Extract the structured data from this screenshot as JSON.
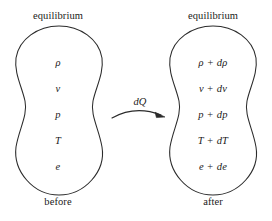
{
  "figure": {
    "background_color": "#ffffff",
    "stroke_color": "#2b2b2b",
    "text_color": "#1a1a1a"
  },
  "left_state": {
    "top_label": "equilibrium",
    "bottom_label": "before",
    "variables": [
      "ρ",
      "v",
      "p",
      "T",
      "e"
    ]
  },
  "right_state": {
    "top_label": "equilibrium",
    "bottom_label": "after",
    "variables": [
      "ρ + dρ",
      "v + dv",
      "p + dp",
      "T + dT",
      "e + de"
    ]
  },
  "transition": {
    "label": "dQ",
    "arrow": "curved-arrow-right"
  }
}
